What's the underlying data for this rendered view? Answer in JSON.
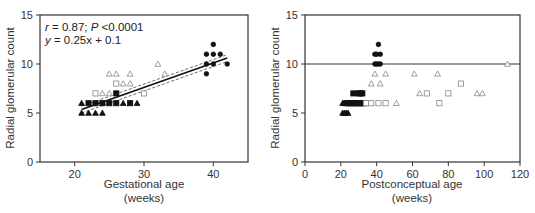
{
  "chart_data": [
    {
      "type": "scatter",
      "title": "",
      "xlabel": "Gestational age",
      "xlabel_unit": "(weeks)",
      "ylabel": "Radial glomerular count",
      "xlim": [
        15,
        45
      ],
      "ylim": [
        0,
        15
      ],
      "xticks": [
        20,
        30,
        40
      ],
      "yticks": [
        0,
        5,
        10,
        15
      ],
      "grid": false,
      "annotations": {
        "stats_r": "r",
        "stats_r_value": " = 0.87; ",
        "stats_p": "P",
        "stats_p_value": " <0.0001",
        "equation_y": "y",
        "equation_rest": " = 0.25x + 0.1"
      },
      "regression": {
        "slope": 0.25,
        "intercept": 0.1,
        "x_range": [
          21,
          42
        ],
        "ci_offset": 0.35
      },
      "series": [
        {
          "name": "filled-triangle",
          "marker": "triangle",
          "filled": true,
          "points": [
            [
              21,
              5
            ],
            [
              22,
              5
            ],
            [
              23,
              5
            ],
            [
              24,
              5
            ],
            [
              21,
              6
            ],
            [
              27,
              6
            ],
            [
              29,
              6
            ]
          ]
        },
        {
          "name": "filled-square",
          "marker": "square",
          "filled": true,
          "points": [
            [
              22,
              6
            ],
            [
              23,
              6
            ],
            [
              24,
              6
            ],
            [
              25,
              6
            ],
            [
              26,
              6
            ],
            [
              28,
              6
            ],
            [
              26,
              7
            ]
          ]
        },
        {
          "name": "open-triangle",
          "marker": "triangle",
          "filled": false,
          "points": [
            [
              25,
              9
            ],
            [
              26,
              9
            ],
            [
              28,
              9
            ],
            [
              24,
              7
            ],
            [
              25,
              7
            ],
            [
              27,
              8
            ],
            [
              28,
              8
            ],
            [
              32,
              10
            ],
            [
              33,
              9
            ]
          ]
        },
        {
          "name": "open-square",
          "marker": "square",
          "filled": false,
          "points": [
            [
              23,
              7
            ],
            [
              26,
              8
            ],
            [
              30,
              7
            ]
          ]
        },
        {
          "name": "filled-circle",
          "marker": "circle",
          "filled": true,
          "points": [
            [
              39,
              9
            ],
            [
              39,
              10
            ],
            [
              39,
              11
            ],
            [
              40,
              10
            ],
            [
              40,
              11
            ],
            [
              40,
              12
            ],
            [
              41,
              11
            ],
            [
              42,
              10
            ]
          ]
        }
      ]
    },
    {
      "type": "scatter",
      "title": "",
      "xlabel": "Postconceptual age",
      "xlabel_unit": "(weeks)",
      "ylabel": "Radial glomerular count",
      "xlim": [
        0,
        120
      ],
      "ylim": [
        0,
        15
      ],
      "xticks": [
        0,
        20,
        40,
        60,
        80,
        100,
        120
      ],
      "yticks": [
        0,
        5,
        10,
        15
      ],
      "grid": false,
      "reference_line_y": 10,
      "series": [
        {
          "name": "filled-triangle",
          "marker": "triangle",
          "filled": true,
          "points": [
            [
              21,
              5
            ],
            [
              22,
              5
            ],
            [
              23,
              5
            ],
            [
              24,
              5
            ],
            [
              21,
              6
            ],
            [
              22,
              6
            ]
          ]
        },
        {
          "name": "filled-square",
          "marker": "square",
          "filled": true,
          "points": [
            [
              23,
              6
            ],
            [
              24,
              6
            ],
            [
              25,
              6
            ],
            [
              26,
              6
            ],
            [
              27,
              6
            ],
            [
              28,
              6
            ],
            [
              29,
              6
            ],
            [
              30,
              6
            ],
            [
              31,
              6
            ],
            [
              32,
              6
            ],
            [
              33,
              6
            ],
            [
              27,
              7
            ],
            [
              30,
              7
            ],
            [
              31,
              7
            ],
            [
              32,
              7
            ]
          ]
        },
        {
          "name": "open-square",
          "marker": "square",
          "filled": false,
          "points": [
            [
              34,
              6
            ],
            [
              37,
              6
            ],
            [
              41,
              6
            ],
            [
              45,
              6
            ],
            [
              68,
              7
            ],
            [
              75,
              6
            ],
            [
              80,
              7
            ],
            [
              87,
              8
            ]
          ]
        },
        {
          "name": "open-triangle",
          "marker": "triangle",
          "filled": false,
          "points": [
            [
              37,
              8
            ],
            [
              42,
              8
            ],
            [
              39,
              9
            ],
            [
              45,
              9
            ],
            [
              51,
              6
            ],
            [
              61,
              9
            ],
            [
              64,
              7
            ],
            [
              74,
              9
            ],
            [
              96,
              7
            ],
            [
              99,
              7
            ],
            [
              113,
              10
            ]
          ]
        },
        {
          "name": "filled-circle",
          "marker": "circle",
          "filled": true,
          "points": [
            [
              39,
              10
            ],
            [
              40,
              10
            ],
            [
              41,
              10
            ],
            [
              42,
              10
            ],
            [
              39,
              11
            ],
            [
              40,
              11
            ],
            [
              42,
              11
            ],
            [
              41,
              12
            ]
          ]
        }
      ]
    }
  ]
}
